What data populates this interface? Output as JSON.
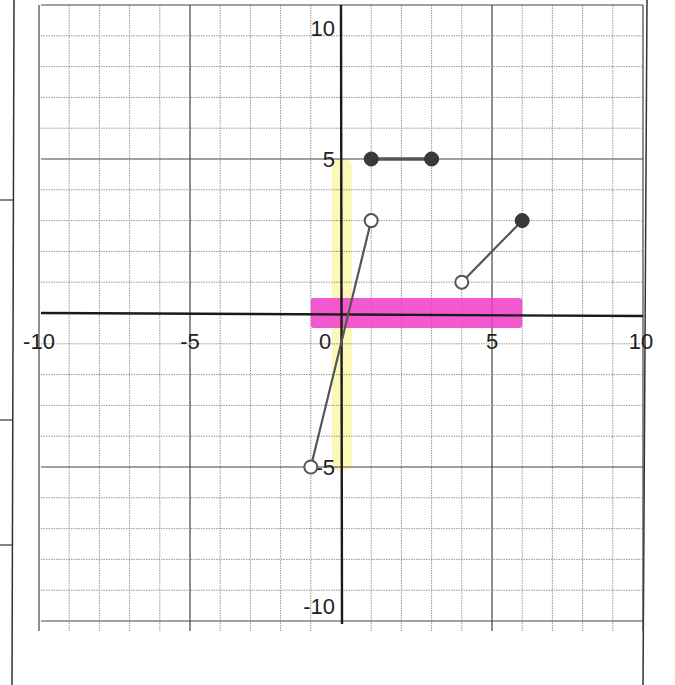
{
  "chart_data": {
    "type": "scatter",
    "title": "",
    "xlabel": "",
    "ylabel": "",
    "xlim": [
      -10,
      10
    ],
    "ylim": [
      -10,
      10
    ],
    "grid": true,
    "grid_minor_step": 1,
    "grid_major_step": 5,
    "x_tick_labels": [
      {
        "value": -10,
        "label": "-10"
      },
      {
        "value": -5,
        "label": "-5"
      },
      {
        "value": 0,
        "label": "0"
      },
      {
        "value": 5,
        "label": "5"
      },
      {
        "value": 10,
        "label": "10"
      }
    ],
    "y_tick_labels": [
      {
        "value": 10,
        "label": "10"
      },
      {
        "value": 5,
        "label": "5"
      },
      {
        "value": -5,
        "label": "-5"
      },
      {
        "value": -10,
        "label": "-10"
      }
    ],
    "segments": [
      {
        "name": "segment-top-horizontal",
        "from": [
          1,
          5
        ],
        "to": [
          3,
          5
        ],
        "from_style": "closed",
        "to_style": "closed"
      },
      {
        "name": "segment-steep",
        "from": [
          -1,
          -5
        ],
        "to": [
          1,
          3
        ],
        "from_style": "open",
        "to_style": "open"
      },
      {
        "name": "segment-right",
        "from": [
          4,
          1
        ],
        "to": [
          6,
          3
        ],
        "from_style": "open",
        "to_style": "closed"
      }
    ],
    "highlights": [
      {
        "name": "domain-highlight",
        "axis": "x",
        "range": [
          -1,
          6
        ],
        "color": "#f03cc8"
      },
      {
        "name": "range-highlight",
        "axis": "y",
        "range": [
          -5,
          5
        ],
        "color": "#fbf7b0"
      }
    ]
  },
  "colors": {
    "axis": "#1a1a1a",
    "grid": "#8a8a8a",
    "ink": "#555555",
    "pink": "#f03cc8",
    "yellow": "#fbf7b0"
  }
}
